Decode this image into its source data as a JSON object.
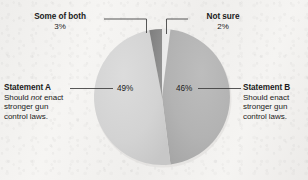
{
  "chart_data": {
    "type": "pie",
    "title": "",
    "subtitle": "",
    "categories": [
      "Statement A",
      "Statement B",
      "Some of both",
      "Not sure"
    ],
    "values": [
      49,
      46,
      3,
      2
    ],
    "value_labels": [
      "49%",
      "46%",
      "3%",
      "2%"
    ],
    "units": "percent",
    "legend_position": "callout-labels",
    "grid": false,
    "slices": [
      {
        "name": "Statement A",
        "value": 49,
        "value_label": "49%",
        "description": "Should not enact stronger gun control laws.",
        "color": "#d2d2d2",
        "label_side": "left"
      },
      {
        "name": "Statement B",
        "value": 46,
        "value_label": "46%",
        "description": "Should enact stronger gun control laws.",
        "color": "#b2b2b2",
        "label_side": "right"
      },
      {
        "name": "Some of both",
        "value": 3,
        "value_label": "3%",
        "description": "",
        "color": "#8a8a8a",
        "label_side": "top-left"
      },
      {
        "name": "Not sure",
        "value": 2,
        "value_label": "2%",
        "description": "",
        "color": "#ebebeb",
        "label_side": "top-right"
      }
    ]
  },
  "labels": {
    "some_of_both": {
      "head": "Some of both",
      "pct": "3%"
    },
    "not_sure": {
      "head": "Not sure",
      "pct": "2%"
    },
    "statement_a": {
      "head": "Statement A",
      "line1_pre": "Should ",
      "line1_em": "not",
      "line1_post": " enact",
      "line2": "stronger gun",
      "line3": "control laws.",
      "pct": "49%"
    },
    "statement_b": {
      "head": "Statement B",
      "line1": "Should enact",
      "line2": "stronger gun",
      "line3": "control laws.",
      "pct": "46%"
    }
  },
  "colors": {
    "background": "#f3f2f0",
    "slice_statement_a": "#d2d2d2",
    "slice_statement_b": "#b2b2b2",
    "slice_some_of_both": "#8a8a8a",
    "slice_not_sure": "#ebebeb",
    "leader_line": "#3a3a3a",
    "text": "#1b1b1b"
  }
}
